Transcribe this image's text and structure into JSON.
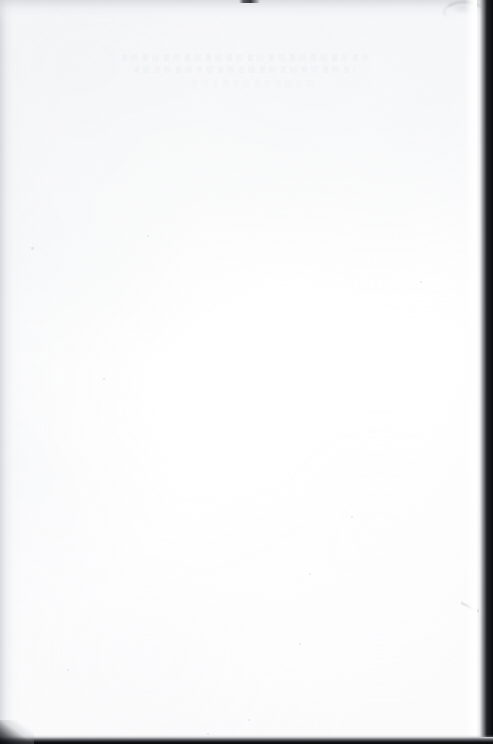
{
  "document": {
    "kind": "scanned-page",
    "page_content": "",
    "legible_text": "",
    "note": "Blank scanned sheet — no legible printed or handwritten text is present."
  },
  "canvas": {
    "width_px": 493,
    "height_px": 744,
    "paper_color": "#ffffff",
    "backdrop_color": "#6b6b6b"
  },
  "artifacts": {
    "top_smudge": {
      "name": "top-edge-smudge",
      "color": "#2a2c32",
      "x_px": 239,
      "y_px": 0,
      "width_px": 21,
      "height_px": 3
    },
    "corner_arc": {
      "name": "top-right-arc-scuff",
      "color": "#acafb5",
      "x_px": 443,
      "y_px": 1,
      "width_px": 42,
      "height_px": 17
    },
    "right_edge_shadow": {
      "name": "right-edge-scanner-shadow",
      "color": "#0a0b0e",
      "width_px": 16,
      "height_px": 737
    },
    "bottom_edge_shadow": {
      "name": "bottom-edge-scanner-shadow",
      "color": "#08090b",
      "height_px": 9
    },
    "bottom_left_corner": {
      "name": "bottom-left-corner-wedge",
      "color": "#0a0b0e",
      "width_px": 34,
      "height_px": 24
    },
    "left_edge_shade": {
      "name": "left-edge-grey-wash",
      "color": "#ccced3",
      "width_px": 22
    },
    "top_edge_shade": {
      "name": "top-edge-grey-wash",
      "color": "#ced0d5",
      "height_px": 26
    },
    "bleed_through": {
      "name": "reverse-side-bleed-through",
      "color": "#e4e6eb",
      "x_px": 118,
      "y_px": 52,
      "width_px": 258,
      "height_px": 44,
      "opacity": 0.3
    }
  }
}
